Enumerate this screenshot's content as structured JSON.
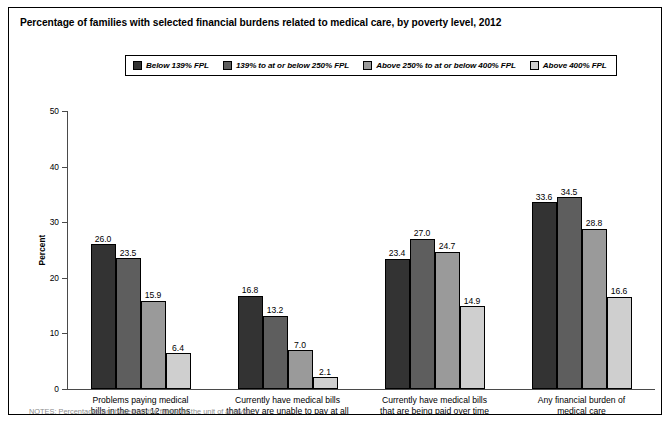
{
  "chart_data": {
    "type": "bar",
    "title": "Percentage of families with selected financial burdens related to medical care, by poverty level, 2012",
    "xlabel": "",
    "ylabel": "Percent",
    "ylim": [
      0,
      50
    ],
    "yticks": [
      0,
      10,
      20,
      30,
      40,
      50
    ],
    "grid": false,
    "legend_position": "top-center",
    "categories": [
      "Problems paying medical\nbills in the past 12 months",
      "Currently have medical bills\nthat they are unable to pay at all",
      "Currently have medical bills\nthat are being paid over time",
      "Any financial burden of\nmedical care"
    ],
    "category_lines": [
      [
        "Problems paying medical",
        "bills in the past 12 months"
      ],
      [
        "Currently have medical bills",
        "that they are unable to pay at all"
      ],
      [
        "Currently have medical bills",
        "that are being paid over time"
      ],
      [
        "Any financial burden of",
        "medical care"
      ]
    ],
    "series": [
      {
        "name": "Below 139% FPL",
        "color": "#333333",
        "values": [
          26.0,
          16.8,
          23.4,
          33.6
        ],
        "labels": [
          "26.0",
          "16.8",
          "23.4",
          "33.6"
        ]
      },
      {
        "name": "139% to at or below 250% FPL",
        "color": "#5e5e5e",
        "values": [
          23.5,
          13.2,
          27.0,
          34.5
        ],
        "labels": [
          "23.5",
          "13.2",
          "27.0",
          "34.5"
        ]
      },
      {
        "name": "Above 250% to at or below 400% FPL",
        "color": "#9a9a9a",
        "values": [
          15.9,
          7.0,
          24.7,
          28.8
        ],
        "labels": [
          "15.9",
          "7.0",
          "24.7",
          "28.8"
        ]
      },
      {
        "name": "Above 400% FPL",
        "color": "#cfcfcf",
        "values": [
          6.4,
          2.1,
          14.9,
          16.6
        ],
        "labels": [
          "6.4",
          "2.1",
          "14.9",
          "16.6"
        ]
      }
    ]
  },
  "footnote": {
    "clipped_text": "NOTES: Percentages are based on the family as the unit of analysis."
  }
}
